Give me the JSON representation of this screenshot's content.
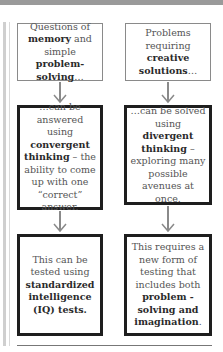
{
  "diagram": {
    "left": {
      "top": {
        "pre": "Questions of ",
        "b1": "memory",
        "mid": " and simple ",
        "b2": "problem-solving",
        "post": "…"
      },
      "middle": {
        "pre": "…can be answered using ",
        "b1": "convergent thinking",
        "post": " – the ability to come up with one “correct” answer."
      },
      "bottom": {
        "pre": "This can be tested using ",
        "b1": "standardized intelligence (IQ) tests."
      }
    },
    "right": {
      "top": {
        "pre": "Problems requiring ",
        "b1": "creative solutions",
        "post": "…"
      },
      "middle": {
        "pre": "…can be solved using ",
        "b1": "divergent thinking",
        "post": " – exploring many possible avenues at once."
      },
      "bottom": {
        "pre": "This requires a new form of testing that includes both ",
        "b1": "problem -solving and imagination",
        "post": "."
      }
    }
  }
}
